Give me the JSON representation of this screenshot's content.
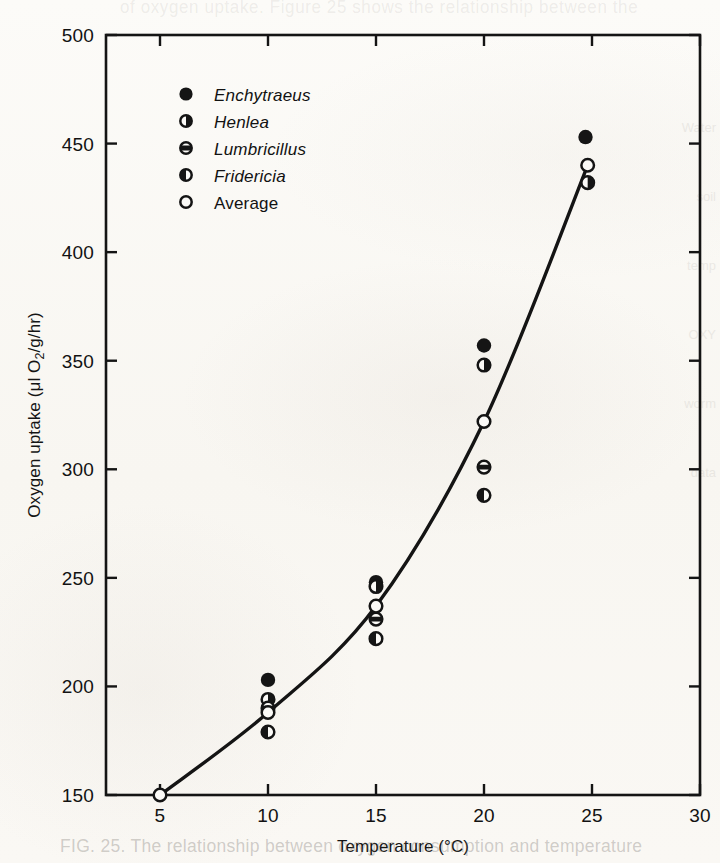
{
  "figure": {
    "bleed_text_top": "of oxygen uptake. Figure 25 shows the relationship between the",
    "bleed_text_bottom": "FIG. 25. The relationship between oxygen consumption and temperature",
    "margin_bleed": [
      "Water",
      "soil",
      "temp",
      "OXY",
      "worm",
      "data"
    ]
  },
  "chart_data": {
    "type": "scatter",
    "title": "",
    "xlabel": "Temperature (°C)",
    "ylabel": "Oxygen uptake (μl O₂/g/hr)",
    "ylabel_parts": {
      "prefix": "Oxygen uptake (μl O",
      "sub": "2",
      "suffix": "/g/hr)"
    },
    "xlim": [
      2.5,
      30
    ],
    "ylim": [
      150,
      500
    ],
    "xticks": [
      5,
      10,
      15,
      20,
      25,
      30
    ],
    "xtick_labels": [
      "5",
      "10",
      "15",
      "20",
      "25",
      "30"
    ],
    "yticks": [
      150,
      200,
      250,
      300,
      350,
      400,
      450,
      500
    ],
    "ytick_labels": [
      "150",
      "200",
      "250",
      "300",
      "350",
      "400",
      "450",
      "500"
    ],
    "grid": false,
    "frame": "box",
    "tick_direction": "in",
    "legend_position": "upper-left-inside",
    "series": [
      {
        "name": "Enchytraeus",
        "marker": "filled-circle",
        "italic": true,
        "points": [
          {
            "x": 10,
            "y": 203
          },
          {
            "x": 15,
            "y": 248
          },
          {
            "x": 20,
            "y": 357
          },
          {
            "x": 24.7,
            "y": 453
          }
        ]
      },
      {
        "name": "Henlea",
        "marker": "right-half-filled-circle",
        "italic": true,
        "points": [
          {
            "x": 10,
            "y": 194
          },
          {
            "x": 15,
            "y": 246
          },
          {
            "x": 20,
            "y": 348
          },
          {
            "x": 24.8,
            "y": 432
          }
        ]
      },
      {
        "name": "Lumbricillus",
        "marker": "band-filled-circle",
        "italic": true,
        "points": [
          {
            "x": 10,
            "y": 190
          },
          {
            "x": 15,
            "y": 231
          },
          {
            "x": 20,
            "y": 301
          }
        ]
      },
      {
        "name": "Fridericia",
        "marker": "left-half-filled-circle",
        "italic": true,
        "points": [
          {
            "x": 10,
            "y": 179
          },
          {
            "x": 15,
            "y": 222
          },
          {
            "x": 20,
            "y": 288
          }
        ]
      },
      {
        "name": "Average",
        "marker": "open-circle",
        "italic": false,
        "points": [
          {
            "x": 5,
            "y": 150
          },
          {
            "x": 10,
            "y": 188
          },
          {
            "x": 15,
            "y": 237
          },
          {
            "x": 20,
            "y": 322
          },
          {
            "x": 24.8,
            "y": 440
          }
        ]
      }
    ],
    "fit_curve": {
      "name": "average-trend-curve",
      "through_points": [
        {
          "x": 5,
          "y": 150
        },
        {
          "x": 10,
          "y": 188
        },
        {
          "x": 15,
          "y": 237
        },
        {
          "x": 20,
          "y": 322
        },
        {
          "x": 24.8,
          "y": 440
        }
      ]
    }
  },
  "legend": {
    "entries": [
      {
        "label": "Enchytraeus",
        "marker": "filled-circle"
      },
      {
        "label": "Henlea",
        "marker": "right-half-filled-circle"
      },
      {
        "label": "Lumbricillus",
        "marker": "band-filled-circle"
      },
      {
        "label": "Fridericia",
        "marker": "left-half-filled-circle"
      },
      {
        "label": "Average",
        "marker": "open-circle"
      }
    ]
  },
  "colors": {
    "ink": "#141414",
    "paper": "#fbfaf7",
    "marker_fill": "#151515",
    "marker_open": "#fbfaf7"
  }
}
